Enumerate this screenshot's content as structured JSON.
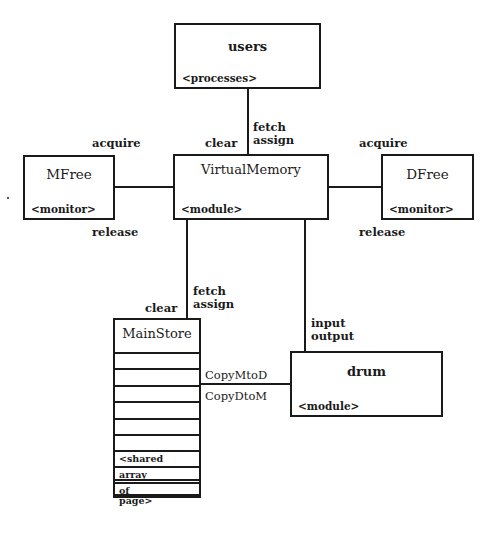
{
  "diagram": {
    "nodes": {
      "users": {
        "name": "users",
        "stereotype": "<processes>"
      },
      "virtual_memory": {
        "name": "VirtualMemory",
        "stereotype": "<module>"
      },
      "mfree": {
        "name": "MFree",
        "stereotype": "<monitor>"
      },
      "dfree": {
        "name": "DFree",
        "stereotype": "<monitor>"
      },
      "main_store": {
        "name": "MainStore",
        "stereotype_lines": [
          "<shared",
          "array",
          "of",
          "page>"
        ]
      },
      "drum": {
        "name": "drum",
        "stereotype": "<module>"
      }
    },
    "edges": {
      "users_vm": {
        "label_right_1": "fetch",
        "label_right_2": "assign",
        "label_left": "clear"
      },
      "mfree_vm": {
        "label_top": "acquire",
        "label_bottom": "release"
      },
      "vm_dfree": {
        "label_top": "acquire",
        "label_bottom": "release"
      },
      "vm_mainstore": {
        "label_right_1": "fetch",
        "label_right_2": "assign",
        "label_left": "clear"
      },
      "vm_drum": {
        "label_1": "input",
        "label_2": "output"
      },
      "mainstore_drum": {
        "label_top": "CopyMtoD",
        "label_bottom": "CopyDtoM"
      }
    }
  }
}
